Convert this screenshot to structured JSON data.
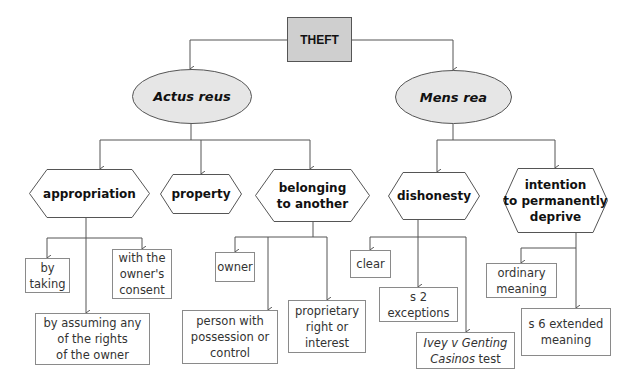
{
  "diagram": {
    "title": "THEFT",
    "colors": {
      "root_fill": "#cfcfcf",
      "ellipse_fill": "#e6e6e6",
      "line": "#555555",
      "leaf_border": "#8a8a8a"
    },
    "branches": [
      {
        "label": "Actus reus",
        "elements": [
          {
            "label": "appropriation",
            "children": [
              "by taking",
              "with the owner's consent",
              "by assuming any of the rights of the owner"
            ]
          },
          {
            "label": "property",
            "children": []
          },
          {
            "label": "belonging to another",
            "children": [
              "owner",
              "person with possession or control",
              "proprietary right or interest"
            ]
          }
        ]
      },
      {
        "label": "Mens rea",
        "elements": [
          {
            "label": "dishonesty",
            "children": [
              "clear",
              "s 2 exceptions",
              "Ivey v Genting Casinos test"
            ]
          },
          {
            "label": "intention to permanently deprive",
            "children": [
              "ordinary meaning",
              "s 6 extended meaning"
            ]
          }
        ]
      }
    ]
  },
  "text": {
    "root": "THEFT",
    "actus": "Actus reus",
    "mens": "Mens rea",
    "appropriation": "appropriation",
    "property": "property",
    "belonging_1": "belonging",
    "belonging_2": "to another",
    "dishonesty": "dishonesty",
    "ipd_1": "intention",
    "ipd_2": "to permanently",
    "ipd_3": "deprive",
    "by_taking_1": "by",
    "by_taking_2": "taking",
    "consent_1": "with the",
    "consent_2": "owner's",
    "consent_3": "consent",
    "assuming_1": "by assuming any",
    "assuming_2": "of the rights",
    "assuming_3": "of the owner",
    "owner": "owner",
    "possession_1": "person with",
    "possession_2": "possession or",
    "possession_3": "control",
    "proprietary_1": "proprietary",
    "proprietary_2": "right or",
    "proprietary_3": "interest",
    "clear": "clear",
    "s2_1": "s 2",
    "s2_2": "exceptions",
    "ivey_1": "Ivey v Genting",
    "ivey_2a": "Casinos",
    "ivey_2b": " test",
    "ordinary_1": "ordinary",
    "ordinary_2": "meaning",
    "s6_1": "s 6 extended",
    "s6_2": "meaning"
  }
}
